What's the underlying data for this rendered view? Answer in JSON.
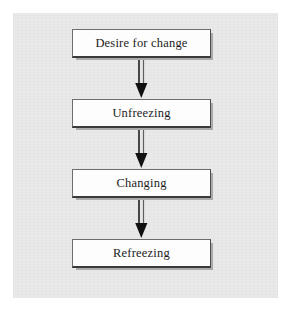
{
  "diagram": {
    "background_color": "#e9e9e9",
    "page_color": "#ffffff",
    "node_fill": "#fdfdfd",
    "node_border_color": "#6d6d6d",
    "text_color": "#1c1c1c",
    "nodes": [
      {
        "id": "desire-for-change",
        "label": "Desire for change"
      },
      {
        "id": "unfreezing",
        "label": "Unfreezing"
      },
      {
        "id": "changing",
        "label": "Changing"
      },
      {
        "id": "refreezing",
        "label": "Refreezing"
      }
    ],
    "connectors": [
      {
        "id": "arrow-1",
        "icon": "down-arrow-icon",
        "from": "desire-for-change",
        "to": "unfreezing"
      },
      {
        "id": "arrow-2",
        "icon": "down-arrow-icon",
        "from": "unfreezing",
        "to": "changing"
      },
      {
        "id": "arrow-3",
        "icon": "down-arrow-icon",
        "from": "changing",
        "to": "refreezing"
      }
    ]
  }
}
